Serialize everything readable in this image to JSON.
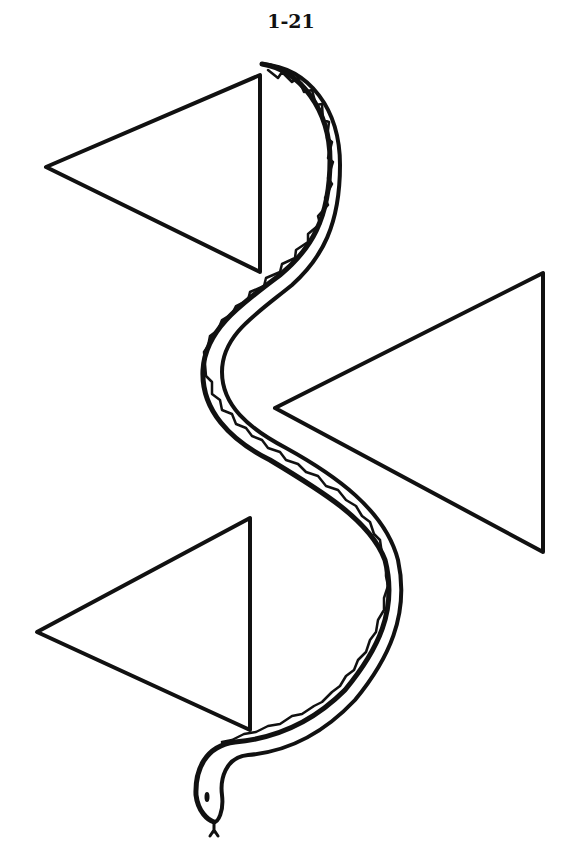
{
  "page": {
    "label": "1-21",
    "background": "#ffffff",
    "ink": "#111111"
  },
  "figure": {
    "triangles": [
      {
        "name": "top-left",
        "points": [
          [
            46,
            167
          ],
          [
            260,
            75
          ],
          [
            260,
            272
          ]
        ]
      },
      {
        "name": "middle-right",
        "points": [
          [
            275,
            408
          ],
          [
            543,
            273
          ],
          [
            543,
            552
          ]
        ]
      },
      {
        "name": "bottom-left",
        "points": [
          [
            37,
            632
          ],
          [
            250,
            518
          ],
          [
            250,
            730
          ]
        ]
      }
    ],
    "snake": {
      "head_position": "bottom",
      "tail_position": "top"
    }
  }
}
